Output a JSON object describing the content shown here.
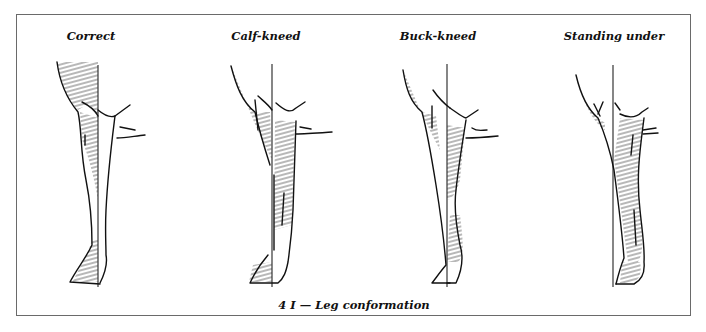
{
  "figure": {
    "caption": "4 I — Leg conformation",
    "panels": [
      {
        "id": "correct",
        "label": "Correct",
        "center_x": 90
      },
      {
        "id": "calf-kneed",
        "label": "Calf-kneed",
        "center_x": 265
      },
      {
        "id": "buck-kneed",
        "label": "Buck-kneed",
        "center_x": 437
      },
      {
        "id": "standing-under",
        "label": "Standing under",
        "center_x": 613
      }
    ]
  },
  "colors": {
    "ink": "#111111",
    "frame": "#6a6a6a",
    "background": "#ffffff"
  }
}
